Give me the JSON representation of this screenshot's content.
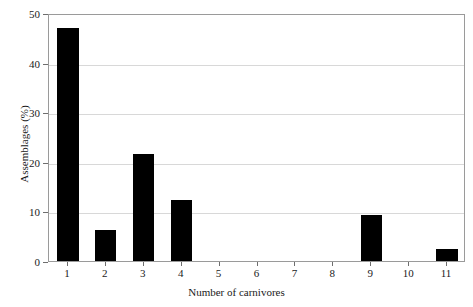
{
  "chart_data": {
    "type": "bar",
    "title": "",
    "xlabel": "Number of carnivores",
    "ylabel": "Assemblages (%)",
    "categories": [
      "1",
      "2",
      "3",
      "4",
      "5",
      "6",
      "7",
      "8",
      "9",
      "10",
      "11"
    ],
    "values": [
      47.0,
      6.3,
      21.6,
      12.3,
      0,
      0,
      0,
      0,
      9.2,
      0,
      2.5
    ],
    "ylim": [
      0,
      50
    ],
    "yticks": [
      0,
      10,
      20,
      30,
      40,
      50
    ],
    "ytick_labels": [
      "0",
      "10",
      "20",
      "30",
      "40",
      "50"
    ],
    "xticks": [
      1,
      2,
      3,
      4,
      5,
      6,
      7,
      8,
      9,
      10,
      11
    ],
    "grid": "horizontal",
    "legend": "none",
    "bar_color": "#000000",
    "grid_color": "#d8d8d8",
    "frame_color": "#9a9a9a",
    "background": "#ffffff"
  }
}
